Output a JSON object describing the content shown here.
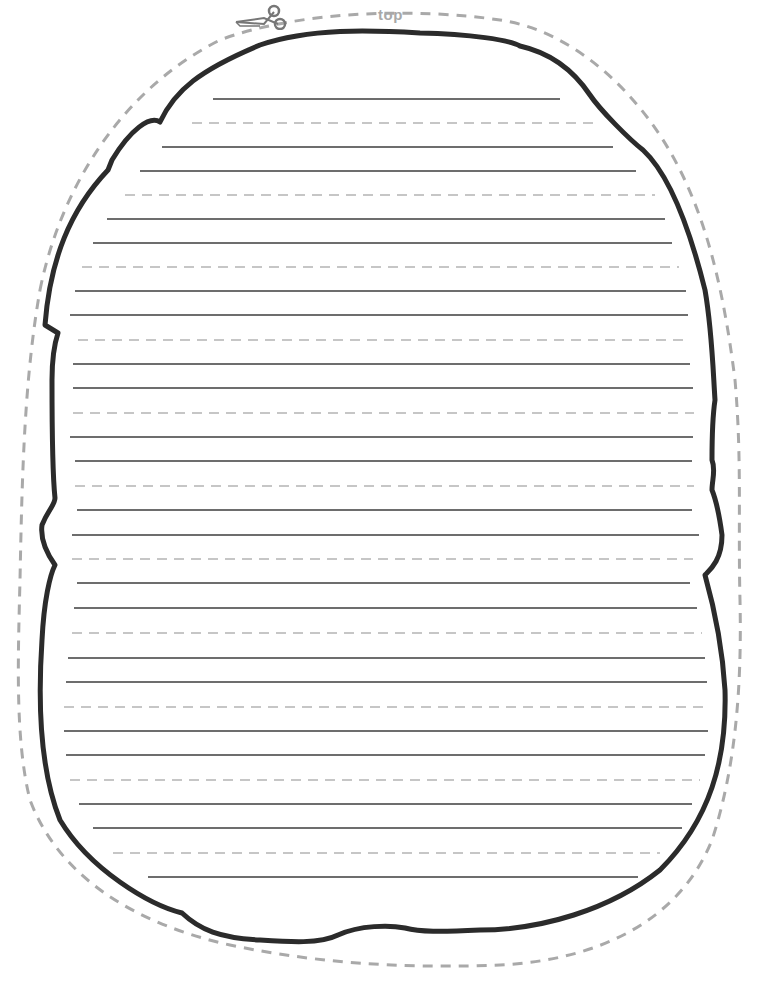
{
  "page": {
    "top_label": "top",
    "colors": {
      "outline": "#2b2b2b",
      "cut_line": "#a9a9a9",
      "solid_rule": "#3c3c3c",
      "dashed_rule": "#b4b4b4",
      "background": "#ffffff"
    },
    "icons": [
      "scissors-icon"
    ],
    "rules": [
      {
        "y": 99,
        "x1": 213,
        "x2": 560,
        "type": "solid"
      },
      {
        "y": 123,
        "x1": 192,
        "x2": 594,
        "type": "dashed"
      },
      {
        "y": 147,
        "x1": 162,
        "x2": 613,
        "type": "solid"
      },
      {
        "y": 171,
        "x1": 140,
        "x2": 636,
        "type": "solid"
      },
      {
        "y": 195,
        "x1": 125,
        "x2": 655,
        "type": "dashed"
      },
      {
        "y": 219,
        "x1": 107,
        "x2": 665,
        "type": "solid"
      },
      {
        "y": 243,
        "x1": 93,
        "x2": 672,
        "type": "solid"
      },
      {
        "y": 267,
        "x1": 82,
        "x2": 679,
        "type": "dashed"
      },
      {
        "y": 291,
        "x1": 75,
        "x2": 686,
        "type": "solid"
      },
      {
        "y": 315,
        "x1": 70,
        "x2": 688,
        "type": "solid"
      },
      {
        "y": 340,
        "x1": 78,
        "x2": 690,
        "type": "dashed"
      },
      {
        "y": 364,
        "x1": 73,
        "x2": 690,
        "type": "solid"
      },
      {
        "y": 388,
        "x1": 73,
        "x2": 693,
        "type": "solid"
      },
      {
        "y": 413,
        "x1": 73,
        "x2": 694,
        "type": "dashed"
      },
      {
        "y": 437,
        "x1": 70,
        "x2": 693,
        "type": "solid"
      },
      {
        "y": 461,
        "x1": 75,
        "x2": 692,
        "type": "solid"
      },
      {
        "y": 486,
        "x1": 75,
        "x2": 694,
        "type": "dashed"
      },
      {
        "y": 510,
        "x1": 77,
        "x2": 692,
        "type": "solid"
      },
      {
        "y": 535,
        "x1": 72,
        "x2": 699,
        "type": "solid"
      },
      {
        "y": 559,
        "x1": 72,
        "x2": 693,
        "type": "dashed"
      },
      {
        "y": 583,
        "x1": 77,
        "x2": 690,
        "type": "solid"
      },
      {
        "y": 608,
        "x1": 74,
        "x2": 697,
        "type": "solid"
      },
      {
        "y": 633,
        "x1": 72,
        "x2": 702,
        "type": "dashed"
      },
      {
        "y": 658,
        "x1": 68,
        "x2": 705,
        "type": "solid"
      },
      {
        "y": 682,
        "x1": 66,
        "x2": 707,
        "type": "solid"
      },
      {
        "y": 707,
        "x1": 64,
        "x2": 708,
        "type": "dashed"
      },
      {
        "y": 731,
        "x1": 64,
        "x2": 708,
        "type": "solid"
      },
      {
        "y": 755,
        "x1": 66,
        "x2": 705,
        "type": "solid"
      },
      {
        "y": 780,
        "x1": 70,
        "x2": 700,
        "type": "dashed"
      },
      {
        "y": 804,
        "x1": 79,
        "x2": 692,
        "type": "solid"
      },
      {
        "y": 828,
        "x1": 93,
        "x2": 682,
        "type": "solid"
      },
      {
        "y": 853,
        "x1": 113,
        "x2": 660,
        "type": "dashed"
      },
      {
        "y": 877,
        "x1": 148,
        "x2": 638,
        "type": "solid"
      }
    ]
  }
}
